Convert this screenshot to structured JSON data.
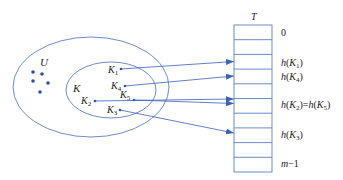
{
  "diagram": {
    "colors": {
      "stroke": "#5b7fc4",
      "dot": "#2a4fb0",
      "text": "#222222"
    },
    "universe": {
      "label": "U"
    },
    "keyset": {
      "label": "K"
    },
    "keys": [
      {
        "base": "K",
        "sub": "1"
      },
      {
        "base": "K",
        "sub": "4"
      },
      {
        "base": "K",
        "sub": "5"
      },
      {
        "base": "K",
        "sub": "2"
      },
      {
        "base": "K",
        "sub": "3"
      }
    ],
    "table": {
      "title": "T",
      "rows": 10,
      "labels": [
        {
          "row": 0,
          "text": "0"
        },
        {
          "row": 2,
          "text": "h(K1)"
        },
        {
          "row": 3,
          "text": "h(K4)"
        },
        {
          "row": 5,
          "text": "h(K2)=h(K5)"
        },
        {
          "row": 7,
          "text": "h(K3)"
        },
        {
          "row": 9,
          "text": "m−1"
        }
      ]
    },
    "mappings": [
      {
        "from": "K1",
        "to_row": 2
      },
      {
        "from": "K4",
        "to_row": 3
      },
      {
        "from": "K2",
        "to_row": 5
      },
      {
        "from": "K5",
        "to_row": 5
      },
      {
        "from": "K3",
        "to_row": 7
      }
    ]
  }
}
